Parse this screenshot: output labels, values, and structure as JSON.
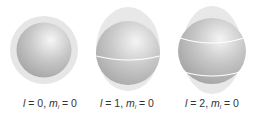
{
  "figure": {
    "panels": [
      {
        "l_label": "l",
        "l_value": "= 0,",
        "m_label": "m",
        "m_sub": "l",
        "m_value": "= 0",
        "lines": 0
      },
      {
        "l_label": "l",
        "l_value": "= 1,",
        "m_label": "m",
        "m_sub": "l",
        "m_value": "= 0",
        "lines": 1
      },
      {
        "l_label": "l",
        "l_value": "= 2,",
        "m_label": "m",
        "m_sub": "l",
        "m_value": "= 0",
        "lines": 2
      }
    ],
    "colors": {
      "outer_shell": "#e4e4e4",
      "sphere_light": "#f2f2f2",
      "sphere_dark": "#a8a8a8",
      "latitude_line": "#ffffff"
    }
  }
}
